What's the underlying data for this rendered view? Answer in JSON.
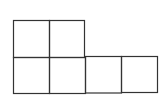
{
  "diagram": {
    "type": "grid-net",
    "stroke_color": "#333333",
    "background": "#ffffff",
    "rows": [
      {
        "row": 1,
        "cells": 2
      },
      {
        "row": 2,
        "cells": 4
      }
    ]
  }
}
